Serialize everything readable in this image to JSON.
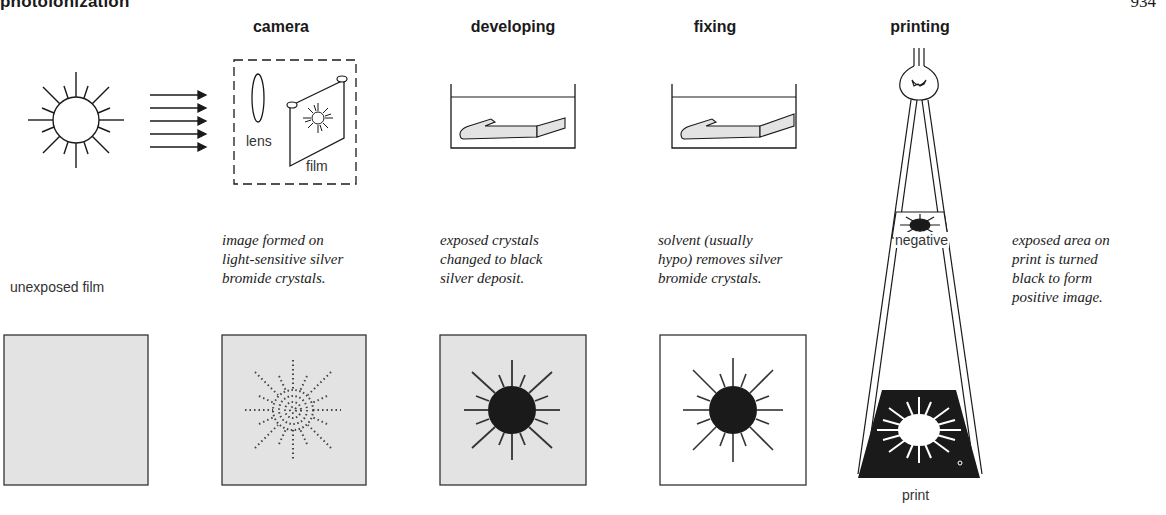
{
  "header": {
    "title": "photoionization",
    "page_number": "934"
  },
  "columns": [
    {
      "id": "source",
      "heading": "",
      "caption": "",
      "bottom_label": "unexposed film"
    },
    {
      "id": "camera",
      "heading": "camera",
      "labels": {
        "lens": "lens",
        "film": "film"
      },
      "caption_lines": [
        "image formed on",
        "light-sensitive silver",
        "bromide crystals."
      ]
    },
    {
      "id": "developing",
      "heading": "developing",
      "caption_lines": [
        "exposed crystals",
        "changed to black",
        "silver deposit."
      ]
    },
    {
      "id": "fixing",
      "heading": "fixing",
      "caption_lines": [
        "solvent (usually",
        "hypo) removes silver",
        "bromide crystals."
      ]
    },
    {
      "id": "printing",
      "heading": "printing",
      "labels": {
        "negative": "negative",
        "print": "print"
      },
      "caption_lines": [
        "exposed area on",
        "print is turned",
        "black to form",
        "positive image."
      ]
    }
  ],
  "colors": {
    "ink": "#1a1a1a",
    "film_gray": "#e3e3e3",
    "paper": "#ffffff"
  }
}
